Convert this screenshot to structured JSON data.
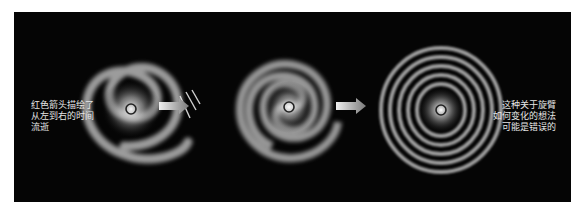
{
  "figure": {
    "panels": [
      {
        "id": "stage-1",
        "description": "two-armed spiral galaxy with red time-flow arrow marks"
      },
      {
        "id": "stage-2",
        "description": "more tightly wound spiral galaxy"
      },
      {
        "id": "stage-3",
        "description": "very tightly wound, nearly circular ring galaxy"
      }
    ],
    "arrows": [
      {
        "from": "stage-1",
        "to": "stage-2",
        "icon": "right-arrow-icon"
      },
      {
        "from": "stage-2",
        "to": "stage-3",
        "icon": "right-arrow-icon"
      }
    ],
    "captions": {
      "left": "红色箭头描绘了\n从左到右的时间\n流逝",
      "right": "这种关于旋臂\n如何变化的想法\n可能是错误的"
    },
    "colors": {
      "background": "#050505",
      "galaxy_glow": "#d8d8d8",
      "caption_text": "#e6e6e6",
      "page": "#ffffff"
    }
  }
}
